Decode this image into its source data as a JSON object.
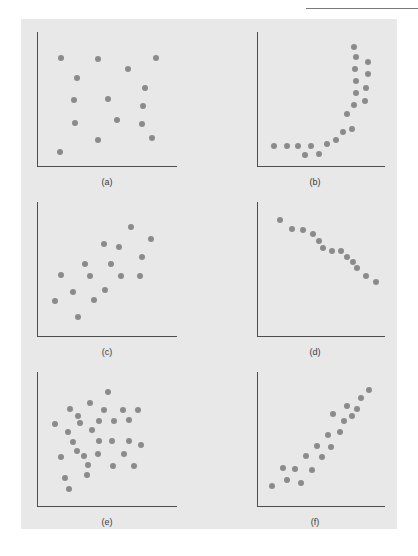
{
  "page": {
    "running_head": "",
    "background_color": "#ffffff",
    "plate_color": "#e8e8e8",
    "axis_color": "#4d4d4d",
    "dot_color": "#8b8b8b"
  },
  "chart_data": [
    {
      "type": "scatter",
      "title": "(a)",
      "label": "(a)",
      "description": "No correlation — randomly dispersed points",
      "xlabel": "",
      "ylabel": "",
      "xlim": [
        0,
        100
      ],
      "ylim": [
        0,
        100
      ],
      "grid": false,
      "legend": false,
      "points": [
        [
          13,
          85
        ],
        [
          42,
          84
        ],
        [
          88,
          85
        ],
        [
          25,
          68
        ],
        [
          66,
          76
        ],
        [
          79,
          60
        ],
        [
          23,
          50
        ],
        [
          50,
          51
        ],
        [
          78,
          45
        ],
        [
          24,
          31
        ],
        [
          57,
          33
        ],
        [
          77,
          30
        ],
        [
          42,
          17
        ],
        [
          85,
          18
        ],
        [
          12,
          7
        ]
      ]
    },
    {
      "type": "scatter",
      "title": "(b)",
      "label": "(b)",
      "description": "Curvilinear (exponential) relationship",
      "xlabel": "",
      "ylabel": "",
      "xlim": [
        0,
        100
      ],
      "ylim": [
        0,
        100
      ],
      "grid": false,
      "legend": false,
      "points": [
        [
          8,
          12
        ],
        [
          19,
          12
        ],
        [
          29,
          12
        ],
        [
          40,
          12
        ],
        [
          35,
          4
        ],
        [
          47,
          5
        ],
        [
          54,
          13
        ],
        [
          62,
          17
        ],
        [
          68,
          23
        ],
        [
          76,
          26
        ],
        [
          72,
          38
        ],
        [
          78,
          46
        ],
        [
          80,
          56
        ],
        [
          88,
          49
        ],
        [
          80,
          66
        ],
        [
          89,
          60
        ],
        [
          79,
          76
        ],
        [
          90,
          72
        ],
        [
          80,
          86
        ],
        [
          90,
          82
        ],
        [
          78,
          94
        ]
      ]
    },
    {
      "type": "scatter",
      "title": "(c)",
      "label": "(c)",
      "description": "Weak positive correlation",
      "xlabel": "",
      "ylabel": "",
      "xlim": [
        0,
        100
      ],
      "ylim": [
        0,
        100
      ],
      "grid": false,
      "legend": false,
      "points": [
        [
          68,
          86
        ],
        [
          84,
          76
        ],
        [
          47,
          72
        ],
        [
          59,
          69
        ],
        [
          77,
          61
        ],
        [
          32,
          55
        ],
        [
          52,
          55
        ],
        [
          13,
          46
        ],
        [
          36,
          45
        ],
        [
          60,
          45
        ],
        [
          75,
          45
        ],
        [
          22,
          32
        ],
        [
          48,
          33
        ],
        [
          8,
          24
        ],
        [
          39,
          25
        ],
        [
          26,
          11
        ]
      ]
    },
    {
      "type": "scatter",
      "title": "(d)",
      "label": "(d)",
      "description": "Strong negative linear correlation",
      "xlabel": "",
      "ylabel": "",
      "xlim": [
        0,
        100
      ],
      "ylim": [
        0,
        100
      ],
      "grid": false,
      "legend": false,
      "points": [
        [
          13,
          92
        ],
        [
          24,
          84
        ],
        [
          33,
          83
        ],
        [
          42,
          80
        ],
        [
          47,
          74
        ],
        [
          51,
          68
        ],
        [
          59,
          66
        ],
        [
          67,
          66
        ],
        [
          72,
          61
        ],
        [
          77,
          57
        ],
        [
          81,
          52
        ],
        [
          89,
          45
        ],
        [
          97,
          40
        ]
      ]
    },
    {
      "type": "scatter",
      "title": "(e)",
      "label": "(e)",
      "description": "No correlation — dense random cloud",
      "xlabel": "",
      "ylabel": "",
      "xlim": [
        0,
        100
      ],
      "ylim": [
        0,
        100
      ],
      "grid": false,
      "legend": false,
      "points": [
        [
          50,
          90
        ],
        [
          36,
          81
        ],
        [
          20,
          76
        ],
        [
          47,
          75
        ],
        [
          62,
          75
        ],
        [
          74,
          75
        ],
        [
          26,
          70
        ],
        [
          43,
          66
        ],
        [
          55,
          66
        ],
        [
          67,
          67
        ],
        [
          28,
          64
        ],
        [
          8,
          63
        ],
        [
          18,
          57
        ],
        [
          37,
          58
        ],
        [
          43,
          49
        ],
        [
          53,
          49
        ],
        [
          67,
          49
        ],
        [
          76,
          46
        ],
        [
          22,
          48
        ],
        [
          25,
          41
        ],
        [
          31,
          37
        ],
        [
          42,
          38
        ],
        [
          13,
          36
        ],
        [
          63,
          38
        ],
        [
          34,
          29
        ],
        [
          54,
          28
        ],
        [
          71,
          28
        ],
        [
          33,
          21
        ],
        [
          16,
          18
        ],
        [
          19,
          9
        ]
      ]
    },
    {
      "type": "scatter",
      "title": "(f)",
      "label": "(f)",
      "description": "Strong positive linear correlation",
      "xlabel": "",
      "ylabel": "",
      "xlim": [
        0,
        100
      ],
      "ylim": [
        0,
        100
      ],
      "grid": false,
      "legend": false,
      "points": [
        [
          6,
          12
        ],
        [
          19,
          17
        ],
        [
          32,
          14
        ],
        [
          16,
          27
        ],
        [
          26,
          26
        ],
        [
          41,
          25
        ],
        [
          36,
          37
        ],
        [
          50,
          36
        ],
        [
          46,
          45
        ],
        [
          58,
          44
        ],
        [
          55,
          54
        ],
        [
          66,
          57
        ],
        [
          69,
          66
        ],
        [
          60,
          72
        ],
        [
          76,
          70
        ],
        [
          72,
          78
        ],
        [
          81,
          76
        ],
        [
          84,
          85
        ],
        [
          91,
          92
        ]
      ]
    }
  ],
  "panels": [
    {
      "label": "(a)"
    },
    {
      "label": "(b)"
    },
    {
      "label": "(c)"
    },
    {
      "label": "(d)"
    },
    {
      "label": "(e)"
    },
    {
      "label": "(f)"
    }
  ]
}
